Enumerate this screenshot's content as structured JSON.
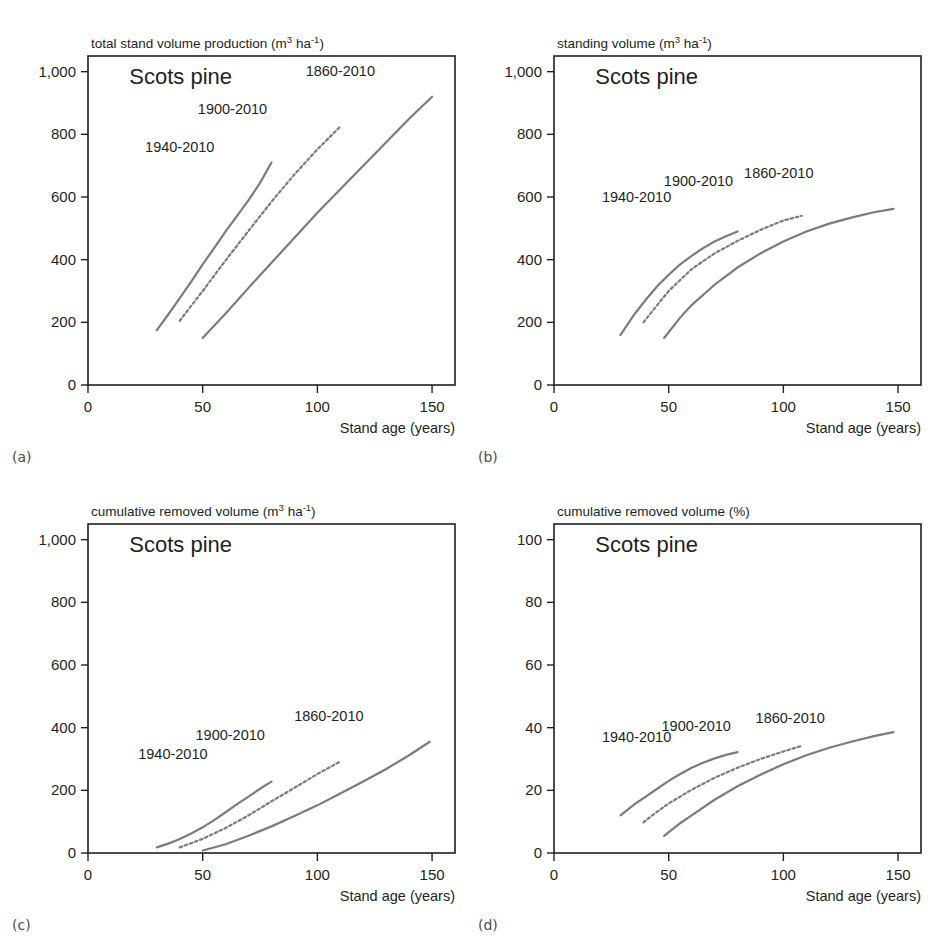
{
  "figure": {
    "species": "Scots pine",
    "x_axis_label": "Stand age (years)",
    "line_color": "#7b7b7b",
    "frame_color": "#231f20"
  },
  "panels": [
    {
      "letter": "(a)",
      "title_main": "total stand volume production (m",
      "title_sup1": "3",
      "title_mid": " ha",
      "title_sup2": "-1",
      "title_end": ")"
    },
    {
      "letter": "(b)",
      "title_main": "standing volume (m",
      "title_sup1": "3",
      "title_mid": " ha",
      "title_sup2": "-1",
      "title_end": ")"
    },
    {
      "letter": "(c)",
      "title_main": "cumulative removed volume (m",
      "title_sup1": "3",
      "title_mid": " ha",
      "title_sup2": "-1",
      "title_end": ")"
    },
    {
      "letter": "(d)",
      "title_main": "cumulative removed volume (%)",
      "title_sup1": "",
      "title_mid": "",
      "title_sup2": "",
      "title_end": ""
    }
  ],
  "chart_data": [
    {
      "type": "line",
      "panel": "(a)",
      "title": "total stand volume production (m3 ha-1)",
      "xlabel": "Stand age (years)",
      "ylabel": "total stand volume production (m3 ha-1)",
      "xlim": [
        0,
        160
      ],
      "ylim": [
        0,
        1050
      ],
      "xticks": [
        0,
        50,
        100,
        150
      ],
      "yticks": [
        0,
        200,
        400,
        600,
        800,
        1000
      ],
      "ytick_labels": [
        "0",
        "200",
        "400",
        "600",
        "800",
        "1,000"
      ],
      "grid": false,
      "legend": "inline-annotations",
      "annotations": [
        "Scots pine",
        "1940-2010",
        "1900-2010",
        "1860-2010"
      ],
      "series": [
        {
          "name": "1940-2010",
          "style": "solid",
          "x": [
            30,
            35,
            40,
            45,
            50,
            55,
            60,
            65,
            70,
            75,
            80
          ],
          "y": [
            175,
            225,
            277,
            330,
            385,
            437,
            490,
            540,
            590,
            645,
            710
          ]
        },
        {
          "name": "1900-2010",
          "style": "dotted",
          "x": [
            40,
            50,
            60,
            70,
            80,
            90,
            100,
            110
          ],
          "y": [
            205,
            300,
            398,
            492,
            585,
            672,
            752,
            825
          ]
        },
        {
          "name": "1860-2010",
          "style": "solid",
          "x": [
            50,
            60,
            70,
            80,
            90,
            100,
            110,
            120,
            130,
            140,
            150
          ],
          "y": [
            150,
            228,
            310,
            390,
            470,
            550,
            625,
            700,
            775,
            850,
            920
          ]
        }
      ]
    },
    {
      "type": "line",
      "panel": "(b)",
      "title": "standing volume (m3 ha-1)",
      "xlabel": "Stand age (years)",
      "ylabel": "standing volume (m3 ha-1)",
      "xlim": [
        0,
        160
      ],
      "ylim": [
        0,
        1050
      ],
      "xticks": [
        0,
        50,
        100,
        150
      ],
      "yticks": [
        0,
        200,
        400,
        600,
        800,
        1000
      ],
      "ytick_labels": [
        "0",
        "200",
        "400",
        "600",
        "800",
        "1,000"
      ],
      "grid": false,
      "legend": "inline-annotations",
      "annotations": [
        "Scots pine",
        "1940-2010",
        "1900-2010",
        "1860-2010"
      ],
      "series": [
        {
          "name": "1940-2010",
          "style": "solid",
          "x": [
            29,
            35,
            40,
            45,
            50,
            55,
            60,
            65,
            70,
            75,
            80
          ],
          "y": [
            160,
            225,
            272,
            315,
            352,
            385,
            412,
            437,
            458,
            475,
            490
          ]
        },
        {
          "name": "1900-2010",
          "style": "dotted",
          "x": [
            39,
            45,
            50,
            60,
            70,
            80,
            90,
            100,
            108
          ],
          "y": [
            200,
            255,
            300,
            370,
            420,
            460,
            495,
            525,
            540
          ]
        },
        {
          "name": "1860-2010",
          "style": "solid",
          "x": [
            48,
            55,
            60,
            70,
            80,
            90,
            100,
            110,
            120,
            130,
            140,
            148
          ],
          "y": [
            150,
            215,
            255,
            320,
            375,
            420,
            458,
            490,
            515,
            535,
            552,
            562
          ]
        }
      ]
    },
    {
      "type": "line",
      "panel": "(c)",
      "title": "cumulative removed volume (m3 ha-1)",
      "xlabel": "Stand age (years)",
      "ylabel": "cumulative removed volume (m3 ha-1)",
      "xlim": [
        0,
        160
      ],
      "ylim": [
        0,
        1050
      ],
      "xticks": [
        0,
        50,
        100,
        150
      ],
      "yticks": [
        0,
        200,
        400,
        600,
        800,
        1000
      ],
      "ytick_labels": [
        "0",
        "200",
        "400",
        "600",
        "800",
        "1,000"
      ],
      "grid": false,
      "legend": "inline-annotations",
      "annotations": [
        "Scots pine",
        "1940-2010",
        "1900-2010",
        "1860-2010"
      ],
      "series": [
        {
          "name": "1940-2010",
          "style": "solid",
          "x": [
            30,
            35,
            40,
            45,
            50,
            55,
            60,
            65,
            70,
            75,
            80
          ],
          "y": [
            18,
            30,
            45,
            62,
            82,
            105,
            130,
            156,
            180,
            205,
            228
          ]
        },
        {
          "name": "1900-2010",
          "style": "dotted",
          "x": [
            40,
            50,
            60,
            70,
            80,
            90,
            100,
            110
          ],
          "y": [
            18,
            45,
            80,
            120,
            165,
            208,
            252,
            292
          ]
        },
        {
          "name": "1860-2010",
          "style": "solid",
          "x": [
            50,
            60,
            70,
            80,
            90,
            100,
            110,
            120,
            130,
            140,
            149
          ],
          "y": [
            8,
            28,
            55,
            85,
            118,
            152,
            190,
            228,
            268,
            312,
            355
          ]
        }
      ]
    },
    {
      "type": "line",
      "panel": "(d)",
      "title": "cumulative removed volume (%)",
      "xlabel": "Stand age (years)",
      "ylabel": "cumulative removed volume (%)",
      "xlim": [
        0,
        160
      ],
      "ylim": [
        0,
        105
      ],
      "xticks": [
        0,
        50,
        100,
        150
      ],
      "yticks": [
        0,
        20,
        40,
        60,
        80,
        100
      ],
      "ytick_labels": [
        "0",
        "20",
        "40",
        "60",
        "80",
        "100"
      ],
      "grid": false,
      "legend": "inline-annotations",
      "annotations": [
        "Scots pine",
        "1940-2010",
        "1900-2010",
        "1860-2010"
      ],
      "series": [
        {
          "name": "1940-2010",
          "style": "solid",
          "x": [
            29,
            35,
            40,
            45,
            50,
            55,
            60,
            65,
            70,
            75,
            80
          ],
          "y": [
            12.0,
            15.5,
            18.0,
            20.5,
            23.0,
            25.2,
            27.2,
            28.8,
            30.2,
            31.3,
            32.2
          ]
        },
        {
          "name": "1900-2010",
          "style": "dotted",
          "x": [
            39,
            45,
            50,
            60,
            70,
            80,
            90,
            100,
            108
          ],
          "y": [
            9.8,
            13.2,
            15.8,
            20.2,
            24.0,
            27.2,
            30.0,
            32.4,
            34.2
          ]
        },
        {
          "name": "1860-2010",
          "style": "solid",
          "x": [
            48,
            55,
            60,
            70,
            80,
            90,
            100,
            110,
            120,
            130,
            140,
            148
          ],
          "y": [
            5.5,
            9.5,
            12.0,
            17.0,
            21.3,
            25.0,
            28.3,
            31.2,
            33.6,
            35.6,
            37.4,
            38.6
          ]
        }
      ]
    }
  ]
}
